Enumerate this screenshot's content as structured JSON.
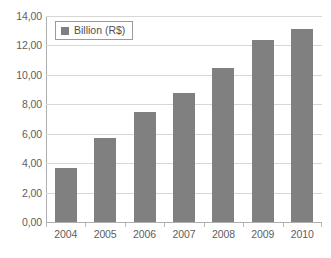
{
  "chart_data": {
    "type": "bar",
    "title": "",
    "xlabel": "",
    "ylabel": "",
    "categories": [
      "2004",
      "2005",
      "2006",
      "2007",
      "2008",
      "2009",
      "2010"
    ],
    "values": [
      3.7,
      5.7,
      7.5,
      8.8,
      10.5,
      12.4,
      13.1
    ],
    "series": [
      {
        "name": "Billion (R$)",
        "values": [
          3.7,
          5.7,
          7.5,
          8.8,
          10.5,
          12.4,
          13.1
        ]
      }
    ],
    "ylim": [
      0,
      14
    ],
    "ytick_step": 2,
    "ytick_labels": [
      "0,00",
      "2,00",
      "4,00",
      "6,00",
      "8,00",
      "10,00",
      "12,00",
      "14,00"
    ],
    "ytick_values": [
      0,
      2,
      4,
      6,
      8,
      10,
      12,
      14
    ],
    "grid": true,
    "legend_position": "top-left-inside",
    "legend_entries": [
      "Billion (R$)"
    ],
    "decimal_separator": ",",
    "colors": {
      "bar": "#808080",
      "gridline": "#d7d7d7",
      "axis": "#b0b0b0",
      "background": "#ffffff",
      "text": "#5e5e5e"
    }
  }
}
